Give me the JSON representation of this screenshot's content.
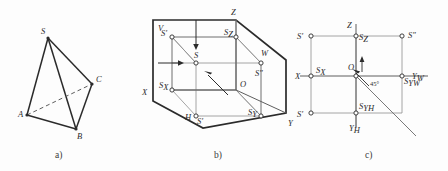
{
  "figure": {
    "background_color": "#fdfdfd",
    "line_color": "#2b2b2b",
    "thin_line_color": "#8a8a8a",
    "text_color": "#2b2b2b"
  },
  "panels": [
    {
      "id": "a",
      "caption": "a)",
      "type": "tetrahedron",
      "description": "Tetrahedron with apex S and base triangle A B C, edge AC drawn dashed (hidden)",
      "vertices": [
        {
          "name": "S",
          "label": "S",
          "x": 48,
          "y": 38,
          "label_dx": -7,
          "label_dy": -4
        },
        {
          "name": "A",
          "label": "A",
          "x": 27,
          "y": 115,
          "label_dx": -9,
          "label_dy": 2
        },
        {
          "name": "B",
          "label": "B",
          "x": 76,
          "y": 129,
          "label_dx": 1,
          "label_dy": 10
        },
        {
          "name": "C",
          "label": "C",
          "x": 92,
          "y": 84,
          "label_dx": 4,
          "label_dy": -2
        }
      ],
      "solid_edges": [
        "S-A",
        "S-B",
        "S-C",
        "A-B",
        "B-C"
      ],
      "dashed_edges": [
        "A-C"
      ]
    },
    {
      "id": "b",
      "caption": "b)",
      "type": "axonometric-projection-box",
      "description": "Three mutually perpendicular projection planes V, H, W forming an open box; point S inside with its projections S', S'' and S(H) plus axis feet Sx, Sy, Sz",
      "axis_labels": [
        {
          "name": "Z",
          "label": "Z",
          "x": 91,
          "y": 12
        },
        {
          "name": "X",
          "label": "X",
          "x": 4,
          "y": 92
        },
        {
          "name": "Y",
          "label": "Y",
          "x": 152,
          "y": 125
        },
        {
          "name": "V",
          "label": "V",
          "x": 21,
          "y": 28
        },
        {
          "name": "H",
          "label": "H",
          "x": 51,
          "y": 122
        },
        {
          "name": "W",
          "label": "W",
          "x": 125,
          "y": 58
        },
        {
          "name": "O",
          "label": "O",
          "x": 104,
          "y": 84
        }
      ],
      "points": [
        {
          "name": "S-front",
          "label": "S",
          "sub": "",
          "x": 32,
          "y": 37,
          "prime": "′",
          "label_dx": -11,
          "label_dy": -2
        },
        {
          "name": "S-space",
          "label": "S",
          "sub": "",
          "x": 56,
          "y": 63,
          "prime": "",
          "label_dx": -2,
          "label_dy": -5
        },
        {
          "name": "S-Z",
          "label": "S",
          "sub": "Z",
          "x": 96,
          "y": 37,
          "prime": "",
          "label_dx": -12,
          "label_dy": -3
        },
        {
          "name": "S-side",
          "label": "S",
          "sub": "",
          "x": 121,
          "y": 63,
          "prime": "″",
          "label_dx": -6,
          "label_dy": 12
        },
        {
          "name": "S-X",
          "label": "S",
          "sub": "X",
          "x": 32,
          "y": 90,
          "prime": "",
          "label_dx": -13,
          "label_dy": -3
        },
        {
          "name": "S-H",
          "label": "S",
          "sub": "",
          "x": 56,
          "y": 116,
          "prime": "′",
          "label_dx": 1,
          "label_dy": 7
        },
        {
          "name": "S-Y",
          "label": "S",
          "sub": "Y",
          "x": 121,
          "y": 116,
          "prime": "",
          "label_dx": -13,
          "label_dy": -2
        }
      ],
      "arrows": [
        {
          "name": "down-arrow-to-H",
          "from_x": 56,
          "from_y": 20,
          "to_x": 56,
          "to_y": 48
        },
        {
          "name": "right-arrow-to-S",
          "from_x": 18,
          "from_y": 63,
          "to_x": 46,
          "to_y": 63
        },
        {
          "name": "diagonal-arrow",
          "from_x": 88,
          "from_y": 95,
          "to_x": 63,
          "to_y": 70
        }
      ]
    },
    {
      "id": "c",
      "caption": "c)",
      "type": "orthographic-multiview",
      "description": "Flattened epure with axes X, Yh, Yw, Z through origin O, projections S', S'', S (horizontal) and the 45 degree bisector",
      "angle_label": "45°",
      "axis_labels": [
        {
          "name": "Z",
          "label": "Z",
          "sub": "",
          "x": 58,
          "y": 24
        },
        {
          "name": "X",
          "label": "X",
          "sub": "",
          "x": 5,
          "y": 73
        },
        {
          "name": "Y-W",
          "label": "Y",
          "sub": "W",
          "x": 116,
          "y": 81
        },
        {
          "name": "Y-H",
          "label": "Y",
          "sub": "H",
          "x": 61,
          "y": 127
        },
        {
          "name": "O",
          "label": "O",
          "sub": "",
          "x": 61,
          "y": 64
        }
      ],
      "points": [
        {
          "name": "S-front",
          "label": "S",
          "sub": "",
          "x": 19,
          "y": 36,
          "prime": "′",
          "label_dx": -13,
          "label_dy": 3
        },
        {
          "name": "S-Z",
          "label": "S",
          "sub": "Z",
          "x": 64,
          "y": 36,
          "prime": "",
          "label_dx": 2,
          "label_dy": 3
        },
        {
          "name": "S-side",
          "label": "S",
          "sub": "",
          "x": 110,
          "y": 36,
          "prime": "″",
          "label_dx": 5,
          "label_dy": 2
        },
        {
          "name": "S-X",
          "label": "S",
          "sub": "X",
          "x": 19,
          "y": 76,
          "prime": "",
          "label_dx": 4,
          "label_dy": -4
        },
        {
          "name": "S-YW",
          "label": "S",
          "sub": "YW",
          "x": 110,
          "y": 76,
          "prime": "",
          "label_dx": 3,
          "label_dy": 8
        },
        {
          "name": "S-horiz",
          "label": "S",
          "sub": "",
          "x": 19,
          "y": 113,
          "prime": "′",
          "label_dx": -13,
          "label_dy": 3
        },
        {
          "name": "S-YH",
          "label": "S",
          "sub": "YH",
          "x": 64,
          "y": 113,
          "prime": "",
          "label_dx": 3,
          "label_dy": -4
        }
      ],
      "arrows": [
        {
          "name": "origin-up-arrow",
          "from_x": 68,
          "from_y": 72,
          "to_x": 68,
          "to_y": 56
        },
        {
          "name": "bisector-arrow",
          "from_x": 75,
          "from_y": 84,
          "to_x": 58,
          "to_y": 67
        }
      ]
    }
  ]
}
